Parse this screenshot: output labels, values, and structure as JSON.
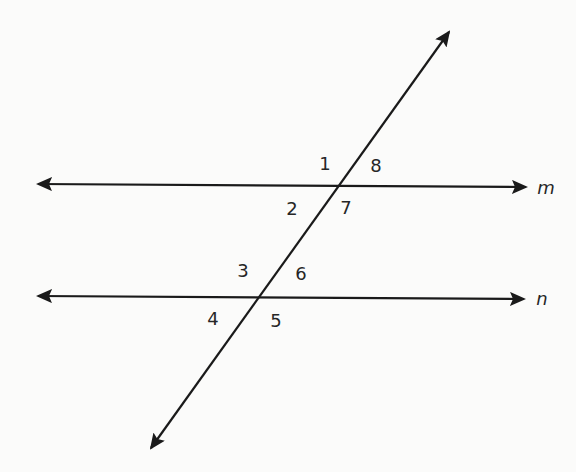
{
  "diagram": {
    "type": "parallel lines cut by a transversal",
    "colors": {
      "background": "#fbfbfa",
      "stroke": "#1a1a1a",
      "text": "#262626"
    },
    "lines": [
      {
        "name": "m",
        "from": [
          38,
          184
        ],
        "to": [
          526,
          187
        ],
        "arrows": "both",
        "label": "m",
        "label_pos": [
          546,
          188
        ]
      },
      {
        "name": "n",
        "from": [
          38,
          296
        ],
        "to": [
          524,
          299
        ],
        "arrows": "both",
        "label": "n",
        "label_pos": [
          542,
          299
        ]
      },
      {
        "name": "transversal",
        "from": [
          151,
          448
        ],
        "to": [
          449,
          32
        ],
        "arrows": "both",
        "label": ""
      }
    ],
    "intersections": [
      {
        "lines": [
          "m",
          "transversal"
        ],
        "point": [
          340,
          185
        ]
      },
      {
        "lines": [
          "n",
          "transversal"
        ],
        "point": [
          260,
          297
        ]
      }
    ],
    "angle_labels": [
      {
        "id": "1",
        "text": "1",
        "pos": [
          325,
          164
        ]
      },
      {
        "id": "8",
        "text": "8",
        "pos": [
          376,
          166
        ]
      },
      {
        "id": "2",
        "text": "2",
        "pos": [
          292,
          209
        ]
      },
      {
        "id": "7",
        "text": "7",
        "pos": [
          346,
          208
        ]
      },
      {
        "id": "3",
        "text": "3",
        "pos": [
          243,
          271
        ]
      },
      {
        "id": "6",
        "text": "6",
        "pos": [
          301,
          274
        ]
      },
      {
        "id": "4",
        "text": "4",
        "pos": [
          213,
          319
        ]
      },
      {
        "id": "5",
        "text": "5",
        "pos": [
          276,
          321
        ]
      }
    ]
  }
}
